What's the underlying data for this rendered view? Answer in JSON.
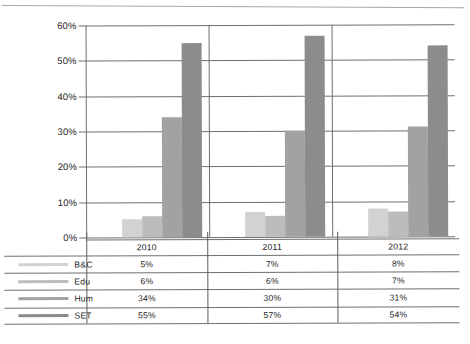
{
  "chart_data": {
    "type": "bar",
    "title": "",
    "subtitle": "",
    "xlabel": "",
    "ylabel": "",
    "categories": [
      "2010",
      "2011",
      "2012"
    ],
    "ylim": [
      0,
      60
    ],
    "ytick_labels": [
      "0%",
      "10%",
      "20%",
      "30%",
      "40%",
      "50%",
      "60%"
    ],
    "ytick_values": [
      0,
      10,
      20,
      30,
      40,
      50,
      60
    ],
    "grid": true,
    "legend_position": "table-left",
    "value_suffix": "%",
    "series": [
      {
        "name": "B&C",
        "color": "#d2d2d2",
        "values": [
          5,
          7,
          8
        ],
        "labels": [
          "5%",
          "7%",
          "8%"
        ]
      },
      {
        "name": "Edu",
        "color": "#bcbcbc",
        "values": [
          6,
          6,
          7
        ],
        "labels": [
          "6%",
          "6%",
          "7%"
        ]
      },
      {
        "name": "Hum",
        "color": "#a2a2a2",
        "values": [
          34,
          30,
          31
        ],
        "labels": [
          "34%",
          "30%",
          "31%"
        ]
      },
      {
        "name": "SET",
        "color": "#8c8c8c",
        "values": [
          55,
          57,
          54
        ],
        "labels": [
          "55%",
          "57%",
          "54%"
        ]
      }
    ]
  },
  "table": {
    "header_row": [
      "",
      "2010",
      "2011",
      "2012"
    ],
    "rows": [
      {
        "label": "B&C",
        "values": [
          "5%",
          "7%",
          "8%"
        ]
      },
      {
        "label": "Edu",
        "values": [
          "6%",
          "6%",
          "7%"
        ]
      },
      {
        "label": "Hum",
        "values": [
          "34%",
          "30%",
          "31%"
        ]
      },
      {
        "label": "SET",
        "values": [
          "55%",
          "57%",
          "54%"
        ]
      }
    ]
  }
}
